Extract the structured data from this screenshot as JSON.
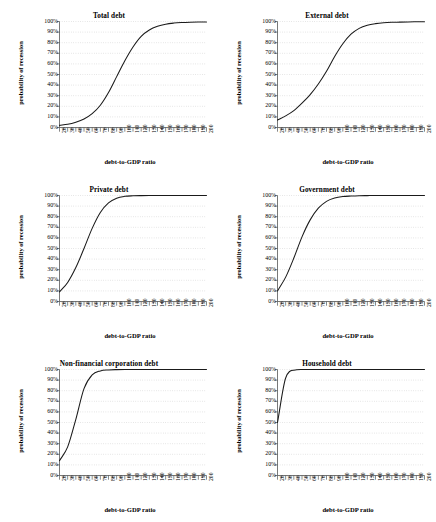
{
  "figure": {
    "panel_count": 6,
    "columns": 2,
    "rows": 3
  },
  "axis": {
    "xlabel": "debt-to-GDP ratio",
    "ylabel": "probability of recession",
    "yticks": [
      "0%",
      "10%",
      "20%",
      "30%",
      "40%",
      "50%",
      "60%",
      "70%",
      "80%",
      "90%",
      "100%"
    ],
    "xticks": [
      "20",
      "30",
      "40",
      "50",
      "60",
      "70",
      "80",
      "90",
      "100",
      "110",
      "120",
      "130",
      "140",
      "150",
      "160",
      "170",
      "180",
      "190",
      "200"
    ]
  },
  "colors": {
    "curve": "#1a1a1a",
    "grid": "#b9b9b9",
    "axis": "#555555",
    "text": "#000000",
    "background": "#ffffff"
  },
  "chart_data": [
    {
      "type": "line",
      "title": "Total debt",
      "xlabel": "debt-to-GDP ratio",
      "ylabel": "probability of recession",
      "xlim": [
        20,
        200
      ],
      "ylim": [
        0,
        100
      ],
      "grid": true,
      "legend": "none",
      "x": [
        20,
        30,
        40,
        50,
        60,
        70,
        80,
        90,
        100,
        110,
        120,
        130,
        140,
        150,
        160,
        170,
        180,
        190,
        200
      ],
      "values": [
        2,
        3,
        5,
        8,
        13,
        21,
        33,
        48,
        63,
        76,
        86,
        92,
        95.5,
        97.5,
        98.5,
        99,
        99.3,
        99.5,
        99.6
      ]
    },
    {
      "type": "line",
      "title": "External debt",
      "xlabel": "debt-to-GDP ratio",
      "ylabel": "probability of recession",
      "xlim": [
        20,
        200
      ],
      "ylim": [
        0,
        100
      ],
      "grid": true,
      "legend": "none",
      "x": [
        20,
        30,
        40,
        50,
        60,
        70,
        80,
        90,
        100,
        110,
        120,
        130,
        140,
        150,
        160,
        170,
        180,
        190,
        200
      ],
      "values": [
        7,
        11,
        16,
        23,
        31,
        41,
        53,
        67,
        79,
        88,
        93.5,
        96.5,
        98,
        98.8,
        99.2,
        99.4,
        99.6,
        99.7,
        99.8
      ]
    },
    {
      "type": "line",
      "title": "Private debt",
      "xlabel": "debt-to-GDP ratio",
      "ylabel": "probability of recession",
      "xlim": [
        20,
        200
      ],
      "ylim": [
        0,
        100
      ],
      "grid": true,
      "legend": "none",
      "x": [
        20,
        30,
        40,
        50,
        60,
        70,
        80,
        90,
        100,
        110,
        120,
        130,
        140,
        150,
        160,
        170,
        180,
        190,
        200
      ],
      "values": [
        9,
        18,
        32,
        50,
        69,
        84,
        93,
        97.5,
        99.2,
        99.7,
        99.9,
        100,
        100,
        100,
        100,
        100,
        100,
        100,
        100
      ]
    },
    {
      "type": "line",
      "title": "Government debt",
      "xlabel": "debt-to-GDP ratio",
      "ylabel": "probability of recession",
      "xlim": [
        20,
        200
      ],
      "ylim": [
        0,
        100
      ],
      "grid": true,
      "legend": "none",
      "x": [
        20,
        30,
        40,
        50,
        60,
        70,
        80,
        90,
        100,
        110,
        120,
        130,
        140,
        150,
        160,
        170,
        180,
        190,
        200
      ],
      "values": [
        10,
        23,
        41,
        61,
        77,
        88,
        94.5,
        97.6,
        99,
        99.5,
        99.8,
        99.9,
        100,
        100,
        100,
        100,
        100,
        100,
        100
      ]
    },
    {
      "type": "line",
      "title": "Non-financial corporation debt",
      "xlabel": "debt-to-GDP ratio",
      "ylabel": "probability of recession",
      "xlim": [
        20,
        200
      ],
      "ylim": [
        0,
        100
      ],
      "grid": true,
      "legend": "none",
      "x": [
        20,
        30,
        40,
        50,
        60,
        70,
        80,
        90,
        100,
        110,
        120,
        130,
        140,
        150,
        160,
        170,
        180,
        190,
        200
      ],
      "values": [
        14,
        27,
        53,
        82,
        95,
        98.7,
        99.6,
        99.9,
        100,
        100,
        100,
        100,
        100,
        100,
        100,
        100,
        100,
        100,
        100
      ]
    },
    {
      "type": "line",
      "title": "Household debt",
      "xlabel": "debt-to-GDP ratio",
      "ylabel": "probability of recession",
      "xlim": [
        20,
        200
      ],
      "ylim": [
        0,
        100
      ],
      "grid": true,
      "legend": "none",
      "x": [
        20,
        30,
        40,
        50,
        60,
        70,
        80,
        90,
        100,
        110,
        120,
        130,
        140,
        150,
        160,
        170,
        180,
        190,
        200
      ],
      "values": [
        50,
        92,
        99.4,
        99.95,
        100,
        100,
        100,
        100,
        100,
        100,
        100,
        100,
        100,
        100,
        100,
        100,
        100,
        100,
        100
      ]
    }
  ]
}
